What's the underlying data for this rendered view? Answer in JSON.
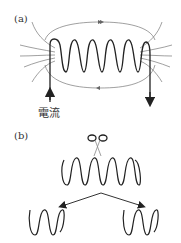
{
  "panel_a": {
    "label": "(a)",
    "current_label": "電流"
  },
  "panel_b": {
    "label": "(b)"
  },
  "colors": {
    "coil": "#222222",
    "field_lines": "#777777"
  }
}
